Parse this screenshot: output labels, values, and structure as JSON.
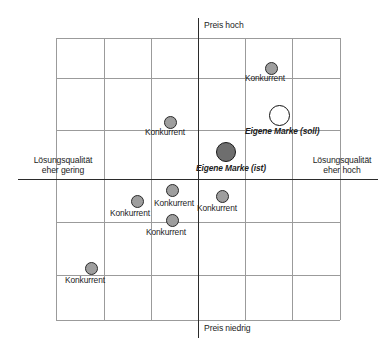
{
  "figure": {
    "kind": "positioning-map",
    "axis_labels": {
      "top": "Preis hoch",
      "bottom": "Preis niedrig",
      "left_line1": "Lösungsqualität",
      "left_line2": "eher gering",
      "right_line1": "Lösungsqualität",
      "right_line2": "eher hoch"
    },
    "colors": {
      "grid": "#9b9b9b",
      "axis": "#2b2b2b",
      "competitor_fill": "#9e9e9e",
      "competitor_stroke": "#2a2a2a",
      "own_current_fill": "#6e6e6e",
      "own_target_fill": "#ffffff",
      "text": "#1c1c1c"
    }
  },
  "chart_data": {
    "type": "scatter",
    "title": "",
    "xlabel": "Lösungsqualität (eher gering → eher hoch)",
    "ylabel": "Preis (niedrig → hoch)",
    "xlim": [
      0,
      8
    ],
    "ylim": [
      0,
      8
    ],
    "grid": true,
    "legend": "none",
    "axis_tick_labels": {
      "x": [
        "eher gering",
        "eher hoch"
      ],
      "y": [
        "Preis niedrig",
        "Preis hoch"
      ]
    },
    "series": [
      {
        "name": "Konkurrent",
        "marker": "filled-grey-circle",
        "points": [
          {
            "label": "Konkurrent",
            "x": 6.15,
            "y": 6.55
          },
          {
            "label": "Konkurrent",
            "x": 3.8,
            "y": 4.95
          },
          {
            "label": "Konkurrent",
            "x": 3.85,
            "y": 2.9
          },
          {
            "label": "Konkurrent",
            "x": 2.65,
            "y": 2.55
          },
          {
            "label": "Konkurrent",
            "x": 3.85,
            "y": 1.85
          },
          {
            "label": "Konkurrent",
            "x": 5.2,
            "y": 2.4
          },
          {
            "label": "Konkurrent",
            "x": 1.15,
            "y": 0.65
          }
        ]
      },
      {
        "name": "Eigene Marke (ist)",
        "marker": "filled-dark-circle",
        "points": [
          {
            "label": "Eigene Marke (ist)",
            "x": 5.4,
            "y": 4.0
          }
        ]
      },
      {
        "name": "Eigene Marke (soll)",
        "marker": "open-circle",
        "points": [
          {
            "label": "Eigene Marke (soll)",
            "x": 6.6,
            "y": 5.35
          }
        ]
      }
    ]
  },
  "markers": [
    {
      "name": "competitor-top-right",
      "label": "Konkurrent",
      "type": "comp",
      "cx": 271,
      "cy": 68,
      "r": 6.5,
      "lx": 245,
      "ly": 74
    },
    {
      "name": "own-brand-target",
      "label": "Eigene Marke (soll)",
      "type": "own-soll",
      "cx": 279,
      "cy": 115,
      "r": 10.5,
      "lx": 245,
      "ly": 127
    },
    {
      "name": "competitor-center-left",
      "label": "Konkurrent",
      "type": "comp",
      "cx": 170,
      "cy": 122,
      "r": 6.5,
      "lx": 145,
      "ly": 128
    },
    {
      "name": "own-brand-current",
      "label": "Eigene Marke (ist)",
      "type": "own-ist",
      "cx": 226,
      "cy": 152,
      "r": 10.0,
      "lx": 196,
      "ly": 164
    },
    {
      "name": "competitor-lower-mid-upper",
      "label": "Konkurrent",
      "type": "comp",
      "cx": 172,
      "cy": 190,
      "r": 6.5,
      "lx": 154,
      "ly": 199
    },
    {
      "name": "competitor-lower-left",
      "label": "Konkurrent",
      "type": "comp",
      "cx": 137,
      "cy": 201,
      "r": 6.5,
      "lx": 110,
      "ly": 209
    },
    {
      "name": "competitor-lower-mid-lower",
      "label": "Konkurrent",
      "type": "comp",
      "cx": 172,
      "cy": 220,
      "r": 6.5,
      "lx": 146,
      "ly": 228
    },
    {
      "name": "competitor-lower-right",
      "label": "Konkurrent",
      "type": "comp",
      "cx": 222,
      "cy": 196,
      "r": 6.5,
      "lx": 197,
      "ly": 204
    },
    {
      "name": "competitor-bottom-left",
      "label": "Konkurrent",
      "type": "comp",
      "cx": 91,
      "cy": 268,
      "r": 6.5,
      "lx": 65,
      "ly": 276
    }
  ],
  "grid": {
    "x_left": 56,
    "x_right": 340,
    "y_top": 38,
    "y_bottom": 320,
    "v_lines": [
      56,
      104,
      151,
      245,
      292,
      340
    ],
    "h_lines": [
      38,
      78,
      130,
      222,
      275,
      320
    ],
    "axis_v_x": 198,
    "axis_v_y1": 18,
    "axis_v_y2": 338,
    "axis_h_y": 179,
    "axis_h_x1": 18,
    "axis_h_x2": 378
  }
}
